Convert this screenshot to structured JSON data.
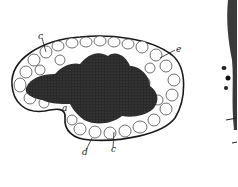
{
  "figure": {
    "labels": [
      {
        "id": "c-top",
        "text": "c",
        "x": 38,
        "y": 32
      },
      {
        "id": "e-right",
        "text": "e",
        "x": 176,
        "y": 45
      },
      {
        "id": "a-mid",
        "text": "a",
        "x": 62,
        "y": 104
      },
      {
        "id": "d-bottom",
        "text": "d",
        "x": 82,
        "y": 148
      },
      {
        "id": "c-bottom",
        "text": "c",
        "x": 111,
        "y": 145
      }
    ],
    "colors": {
      "ink": "#1a1a1a",
      "paper": "#ffffff",
      "mass": "#222222"
    }
  }
}
